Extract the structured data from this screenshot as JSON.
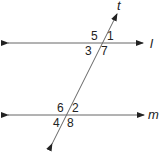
{
  "diagram": {
    "lines": {
      "l": {
        "label": "l"
      },
      "m": {
        "label": "m"
      },
      "t": {
        "label": "t"
      }
    },
    "angles": {
      "a1": "1",
      "a2": "2",
      "a3": "3",
      "a4": "4",
      "a5": "5",
      "a6": "6",
      "a7": "7",
      "a8": "8"
    },
    "colors": {
      "line": "#555555",
      "text": "#222222"
    }
  }
}
